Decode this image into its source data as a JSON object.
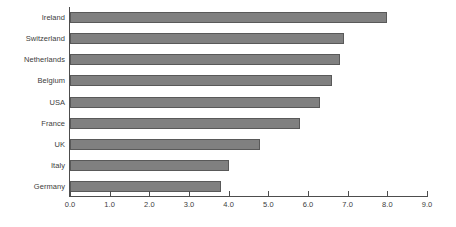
{
  "chart_data": {
    "type": "bar",
    "orientation": "horizontal",
    "title": "",
    "subtitle": "",
    "xlabel": "",
    "ylabel": "",
    "categories": [
      "Ireland",
      "Switzerland",
      "Netherlands",
      "Belgium",
      "USA",
      "France",
      "UK",
      "Italy",
      "Germany"
    ],
    "values": [
      8.0,
      6.9,
      6.8,
      6.6,
      6.3,
      5.8,
      4.8,
      4.0,
      3.8
    ],
    "series": [
      {
        "name": "",
        "values": [
          8.0,
          6.9,
          6.8,
          6.6,
          6.3,
          5.8,
          4.8,
          4.0,
          3.8
        ]
      }
    ],
    "xlim": [
      0.0,
      9.0
    ],
    "xticks": [
      0.0,
      1.0,
      2.0,
      3.0,
      4.0,
      5.0,
      6.0,
      7.0,
      8.0,
      9.0
    ],
    "xtick_labels": [
      "0.0",
      "1.0",
      "2.0",
      "3.0",
      "4.0",
      "5.0",
      "6.0",
      "7.0",
      "8.0",
      "9.0"
    ],
    "grid": false,
    "legend": false,
    "legend_position": "none",
    "annotations": [],
    "colors": {
      "bar_fill": "#808080",
      "bar_border": "#595959",
      "axis": "#4d4d4d",
      "text": "#3c3c3c",
      "background": "#ffffff"
    }
  }
}
